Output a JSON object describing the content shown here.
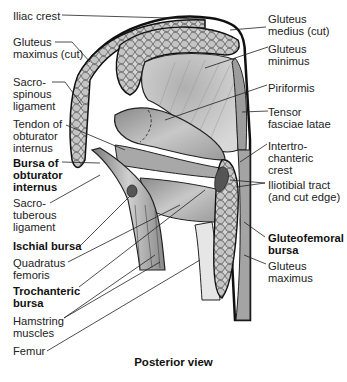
{
  "figure": {
    "view_caption": "Posterior view",
    "labels_left": [
      {
        "id": "iliac-crest",
        "text": "Iliac crest",
        "bold": false
      },
      {
        "id": "gluteus-maximus-cut",
        "text": "Gluteus\nmaximus (cut)",
        "bold": false
      },
      {
        "id": "sacrospinous-ligament",
        "text": "Sacro-\nspinous\nligament",
        "bold": false
      },
      {
        "id": "tendon-obturator-internus",
        "text": "Tendon of\nobturator\ninternus",
        "bold": false
      },
      {
        "id": "bursa-obturator-internus",
        "text": "Bursa of\nobturator\ninternus",
        "bold": true
      },
      {
        "id": "sacrotuberous-ligament",
        "text": "Sacro-\ntuberous\nligament",
        "bold": false
      },
      {
        "id": "ischial-bursa",
        "text": "Ischial bursa",
        "bold": true
      },
      {
        "id": "quadratus-femoris",
        "text": "Quadratus\nfemoris",
        "bold": false
      },
      {
        "id": "trochanteric-bursa",
        "text": "Trochanteric\nbursa",
        "bold": true
      },
      {
        "id": "hamstring-muscles",
        "text": "Hamstring\nmuscles",
        "bold": false
      },
      {
        "id": "femur",
        "text": "Femur",
        "bold": false
      }
    ],
    "labels_right": [
      {
        "id": "gluteus-medius-cut",
        "text": "Gluteus\nmedius (cut)",
        "bold": false
      },
      {
        "id": "gluteus-minimus",
        "text": "Gluteus\nminimus",
        "bold": false
      },
      {
        "id": "piriformis",
        "text": "Piriformis",
        "bold": false
      },
      {
        "id": "tensor-fasciae-latae",
        "text": "Tensor\nfasciae latae",
        "bold": false
      },
      {
        "id": "intertrochanteric-crest",
        "text": "Intertro-\nchanteric\ncrest",
        "bold": false
      },
      {
        "id": "iliotibial-tract",
        "text": "Iliotibial tract\n(and cut edge)",
        "bold": false
      },
      {
        "id": "gluteofemoral-bursa",
        "text": "Gluteofemoral\nbursa",
        "bold": true
      },
      {
        "id": "gluteus-maximus",
        "text": "Gluteus\nmaximus",
        "bold": false
      }
    ]
  }
}
